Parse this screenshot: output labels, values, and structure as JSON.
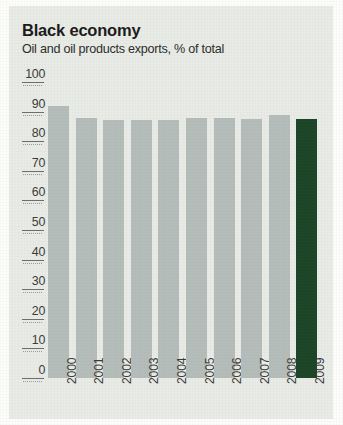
{
  "header": {
    "title": "Black economy",
    "subtitle": "Oil and oil products exports, % of total"
  },
  "colors": {
    "panel_background": "#e9ebe6",
    "bar_default": "#b4bdb9",
    "bar_highlight": "#1b4526",
    "axis_text": "#3a3a3a",
    "title_text": "#1a1a1a"
  },
  "chart_data": {
    "type": "bar",
    "title": "Black economy",
    "subtitle": "Oil and oil products exports, % of total",
    "xlabel": "",
    "ylabel": "% of total",
    "categories": [
      "2000",
      "2001",
      "2002",
      "2003",
      "2004",
      "2005",
      "2006",
      "2007",
      "2008",
      "2009"
    ],
    "values": [
      92,
      88,
      87,
      87,
      87,
      88,
      88,
      87.5,
      89,
      87.5
    ],
    "ylim": [
      0,
      100
    ],
    "yticks": [
      0,
      10,
      20,
      30,
      40,
      50,
      60,
      70,
      80,
      90,
      100
    ],
    "ytick_labels": [
      "0",
      "10",
      "20",
      "30",
      "40",
      "50",
      "60",
      "70",
      "80",
      "90",
      "100"
    ],
    "grid": false,
    "legend": "none",
    "highlight_category": "2009",
    "series": [
      {
        "name": "Oil and oil products exports, % of total",
        "values": [
          92,
          88,
          87,
          87,
          87,
          88,
          88,
          87.5,
          89,
          87.5
        ]
      }
    ]
  }
}
